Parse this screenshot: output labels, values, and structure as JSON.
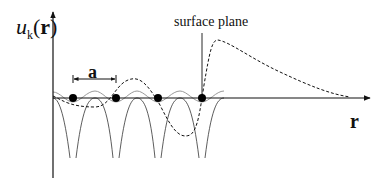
{
  "diagram": {
    "y_axis_label": {
      "symbol": "u",
      "subscript": "k",
      "open": "(",
      "arg": "r",
      "close": ")"
    },
    "x_axis_label": "r",
    "lattice_constant_label": "a",
    "surface_label": "surface plane",
    "atoms": [
      73,
      116,
      158,
      202
    ],
    "colors": {
      "line": "#111111",
      "grey_curve": "#9a9a9a",
      "atom": "#000000"
    }
  }
}
